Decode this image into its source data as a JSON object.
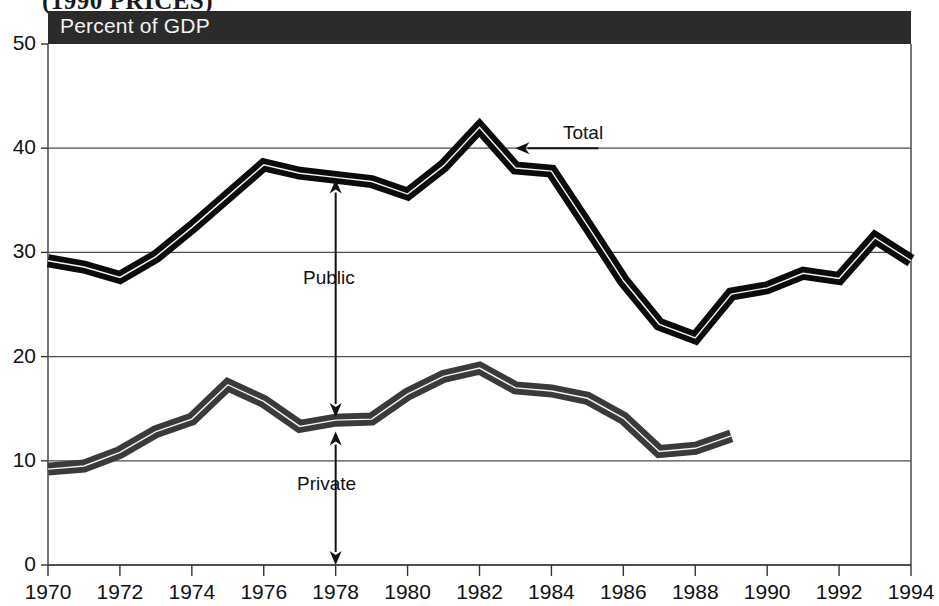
{
  "figure": {
    "suptitle": "(1990 PRICES)",
    "banner_label": "Percent of GDP",
    "banner_color": "#2b2b2b"
  },
  "annotations": {
    "total": "Total",
    "public": "Public",
    "private": "Private"
  },
  "chart_data": {
    "type": "line",
    "title": "Percent of GDP",
    "subtitle": "(1990 PRICES)",
    "xlabel": "",
    "ylabel": "Percent of GDP",
    "xlim": [
      1970,
      1994
    ],
    "ylim": [
      0,
      50
    ],
    "yticks": [
      0,
      10,
      20,
      30,
      40,
      50
    ],
    "ytick_labels": [
      "0",
      "10",
      "20",
      "30",
      "40",
      "50"
    ],
    "xticks": [
      1970,
      1972,
      1974,
      1976,
      1978,
      1980,
      1982,
      1984,
      1986,
      1988,
      1990,
      1992,
      1994
    ],
    "xtick_labels": [
      "1970",
      "1972",
      "1974",
      "1976",
      "1978",
      "1980",
      "1982",
      "1984",
      "1986",
      "1988",
      "1990",
      "1992",
      "1994"
    ],
    "grid": "horizontal",
    "gridlines_at": [
      0,
      10,
      20,
      30,
      40
    ],
    "legend": "inline-annotations",
    "x": [
      1970,
      1971,
      1972,
      1973,
      1974,
      1975,
      1976,
      1977,
      1978,
      1979,
      1980,
      1981,
      1982,
      1983,
      1984,
      1985,
      1986,
      1987,
      1988,
      1989,
      1990,
      1991,
      1992,
      1993,
      1994
    ],
    "series": [
      {
        "name": "Total",
        "color": "#0b0b0b",
        "values": [
          29.2,
          28.6,
          27.6,
          29.6,
          32.4,
          35.4,
          38.4,
          37.6,
          37.2,
          36.8,
          35.6,
          38.3,
          42.0,
          38.1,
          37.8,
          32.6,
          27.3,
          23.1,
          21.8,
          26.0,
          26.6,
          28.0,
          27.5,
          31.4,
          29.2
        ]
      },
      {
        "name": "Private",
        "color": "#3a3a3a",
        "values": [
          9.2,
          9.5,
          10.8,
          12.8,
          14.0,
          17.3,
          15.7,
          13.3,
          13.9,
          14.0,
          16.4,
          18.1,
          18.9,
          17.0,
          16.7,
          16.0,
          14.1,
          10.9,
          11.2,
          12.4,
          null,
          null,
          null,
          null,
          null
        ]
      }
    ],
    "notes": [
      {
        "text": "Total",
        "type": "arrow-left",
        "at_x": 1983.0,
        "at_y": 40.0
      },
      {
        "text": "Public",
        "type": "double-arrow-vertical",
        "at_x": 1978,
        "from_y": 14.2,
        "to_y": 37.0
      },
      {
        "text": "Private",
        "type": "double-arrow-vertical",
        "at_x": 1978,
        "from_y": 0.0,
        "to_y": 12.8
      }
    ]
  }
}
